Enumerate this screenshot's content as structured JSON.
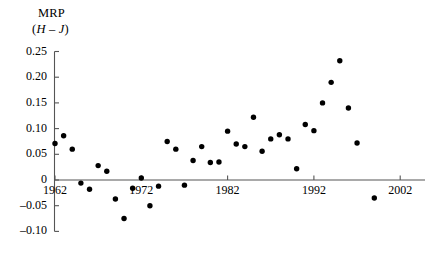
{
  "chart_data": {
    "type": "scatter",
    "title": "MRP",
    "subtitle_prefix": "(",
    "subtitle_italic": "H – J",
    "subtitle_suffix": ")",
    "xlabel": "",
    "ylabel": "MRP (H - J)",
    "grid": false,
    "legend": "none",
    "xlim": [
      1959.5,
      2003.5
    ],
    "ylim": [
      -0.105,
      0.255
    ],
    "xticks": [
      1962,
      1972,
      1982,
      1992,
      2002
    ],
    "xtick_labels": [
      "1962",
      "1972",
      "1982",
      "1992",
      "2002"
    ],
    "yticks": [
      0.25,
      0.2,
      0.15,
      0.1,
      0.05,
      0,
      -0.05,
      -0.1
    ],
    "ytick_labels": [
      "0.25",
      "0.20",
      "0.15",
      "0.10",
      "0.05",
      "0",
      "–0.05",
      "–0.10"
    ],
    "marker": "filled-circle",
    "marker_color": "#000000",
    "axis_color": "#555555",
    "points": [
      {
        "x": 1962,
        "y": 0.071
      },
      {
        "x": 1963,
        "y": 0.086
      },
      {
        "x": 1964,
        "y": 0.06
      },
      {
        "x": 1965,
        "y": -0.006
      },
      {
        "x": 1966,
        "y": -0.018
      },
      {
        "x": 1967,
        "y": 0.028
      },
      {
        "x": 1968,
        "y": 0.017
      },
      {
        "x": 1969,
        "y": -0.037
      },
      {
        "x": 1970,
        "y": -0.075
      },
      {
        "x": 1971,
        "y": -0.016
      },
      {
        "x": 1972,
        "y": 0.004
      },
      {
        "x": 1973,
        "y": -0.05
      },
      {
        "x": 1974,
        "y": -0.012
      },
      {
        "x": 1975,
        "y": 0.075
      },
      {
        "x": 1976,
        "y": 0.06
      },
      {
        "x": 1977,
        "y": -0.01
      },
      {
        "x": 1978,
        "y": 0.038
      },
      {
        "x": 1979,
        "y": 0.065
      },
      {
        "x": 1980,
        "y": 0.034
      },
      {
        "x": 1981,
        "y": 0.035
      },
      {
        "x": 1982,
        "y": 0.095
      },
      {
        "x": 1983,
        "y": 0.07
      },
      {
        "x": 1984,
        "y": 0.065
      },
      {
        "x": 1985,
        "y": 0.122
      },
      {
        "x": 1986,
        "y": 0.056
      },
      {
        "x": 1987,
        "y": 0.08
      },
      {
        "x": 1988,
        "y": 0.088
      },
      {
        "x": 1989,
        "y": 0.08
      },
      {
        "x": 1990,
        "y": 0.022
      },
      {
        "x": 1991,
        "y": 0.108
      },
      {
        "x": 1992,
        "y": 0.096
      },
      {
        "x": 1993,
        "y": 0.15
      },
      {
        "x": 1994,
        "y": 0.19
      },
      {
        "x": 1995,
        "y": 0.232
      },
      {
        "x": 1996,
        "y": 0.14
      },
      {
        "x": 1997,
        "y": 0.072
      },
      {
        "x": 1999,
        "y": -0.035
      }
    ]
  }
}
